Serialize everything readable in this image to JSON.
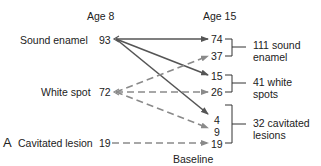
{
  "panel_label": "A",
  "caption": "Baseline",
  "columns": {
    "left": "Age 8",
    "right": "Age 15"
  },
  "age8": [
    {
      "label": "Sound enamel",
      "value": "93"
    },
    {
      "label": "White spot",
      "value": "72"
    },
    {
      "label": "Cavitated lesion",
      "value": "19"
    }
  ],
  "age15": [
    "74",
    "37",
    "15",
    "26",
    "4",
    "9",
    "19"
  ],
  "groups": [
    {
      "line1": "111 sound",
      "line2": "enamel"
    },
    {
      "line1": "41 white",
      "line2": "spots"
    },
    {
      "line1": "32 cavitated",
      "line2": "lesions"
    }
  ],
  "transitions": [
    {
      "from": "Sound enamel",
      "to": "Sound enamel",
      "count": "74",
      "style": "solid"
    },
    {
      "from": "Sound enamel",
      "to": "White spot",
      "count": "15",
      "style": "solid"
    },
    {
      "from": "Sound enamel",
      "to": "Cavitated lesion",
      "count": "4",
      "style": "solid"
    },
    {
      "from": "White spot",
      "to": "Sound enamel",
      "count": "37",
      "style": "dashed"
    },
    {
      "from": "White spot",
      "to": "White spot",
      "count": "26",
      "style": "dashed"
    },
    {
      "from": "White spot",
      "to": "Cavitated lesion",
      "count": "9",
      "style": "dashed"
    },
    {
      "from": "Cavitated lesion",
      "to": "Cavitated lesion",
      "count": "19",
      "style": "dashed"
    }
  ],
  "colors": {
    "solid_line": "#555555",
    "dashed_line": "#8a8a8a",
    "text": "#222222"
  }
}
